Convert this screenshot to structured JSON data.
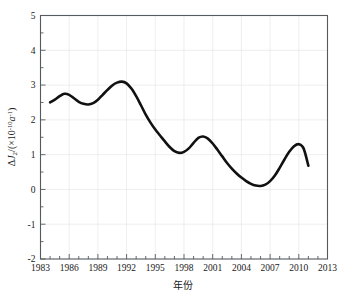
{
  "chart_data": {
    "type": "line",
    "title": "",
    "xlabel": "年份",
    "ylabel": "ΔJ2/(×10^-10 a^-1)",
    "ylabel_parts": {
      "delta": "Δ",
      "symbol": "J",
      "subscript": "2",
      "divider": "/(×10",
      "exponent1": "-10",
      "unit": "a",
      "exponent2": "-1",
      "close": ")"
    },
    "xlim": [
      1983,
      2013
    ],
    "ylim": [
      -2,
      5
    ],
    "xticks": [
      1983,
      1986,
      1989,
      1992,
      1995,
      1998,
      2001,
      2004,
      2007,
      2010,
      2013
    ],
    "xtick_labels": [
      "1983",
      "1986",
      "1989",
      "1992",
      "1995",
      "1998",
      "2001",
      "2004",
      "2007",
      "2010",
      "2013"
    ],
    "yticks": [
      -2,
      -1,
      0,
      1,
      2,
      3,
      4,
      5
    ],
    "ytick_labels": [
      "-2",
      "-1",
      "0",
      "1",
      "2",
      "3",
      "4",
      "5"
    ],
    "xtick_minor_step": 1,
    "ytick_minor_step": 0.5,
    "grid": true,
    "legend": "none",
    "line_color": "#111111",
    "grid_color": "#e2e2e2",
    "frame_color": "#555a5e",
    "series": [
      {
        "name": "ΔJ2",
        "x": [
          1984.0,
          1984.5,
          1985.0,
          1985.5,
          1986.0,
          1986.5,
          1987.0,
          1987.5,
          1988.0,
          1988.5,
          1989.0,
          1989.5,
          1990.0,
          1990.5,
          1991.0,
          1991.5,
          1992.0,
          1992.5,
          1993.0,
          1993.5,
          1994.0,
          1994.5,
          1995.0,
          1995.5,
          1996.0,
          1996.5,
          1997.0,
          1997.5,
          1998.0,
          1998.5,
          1999.0,
          1999.5,
          2000.0,
          2000.5,
          2001.0,
          2001.5,
          2002.0,
          2002.5,
          2003.0,
          2003.5,
          2004.0,
          2004.5,
          2005.0,
          2005.5,
          2006.0,
          2006.5,
          2007.0,
          2007.5,
          2008.0,
          2008.5,
          2009.0,
          2009.5,
          2010.0,
          2010.5,
          2011.0
        ],
        "y": [
          2.5,
          2.58,
          2.68,
          2.75,
          2.72,
          2.62,
          2.52,
          2.46,
          2.44,
          2.48,
          2.58,
          2.72,
          2.86,
          2.99,
          3.07,
          3.1,
          3.05,
          2.9,
          2.68,
          2.42,
          2.15,
          1.92,
          1.72,
          1.55,
          1.38,
          1.22,
          1.1,
          1.05,
          1.08,
          1.18,
          1.34,
          1.48,
          1.52,
          1.46,
          1.32,
          1.14,
          0.95,
          0.76,
          0.6,
          0.46,
          0.34,
          0.24,
          0.16,
          0.11,
          0.1,
          0.14,
          0.24,
          0.4,
          0.62,
          0.86,
          1.08,
          1.24,
          1.3,
          1.18,
          0.68
        ]
      }
    ],
    "annotations": {
      "peaks": [
        {
          "year": 1985.5,
          "value": 2.75
        },
        {
          "year": 1991.5,
          "value": 3.1
        },
        {
          "year": 2000.0,
          "value": 1.52
        },
        {
          "year": 2010.0,
          "value": 1.3
        }
      ],
      "troughs": [
        {
          "year": 1988.0,
          "value": 2.44
        },
        {
          "year": 1997.5,
          "value": 1.05
        },
        {
          "year": 2006.0,
          "value": 0.1
        }
      ]
    }
  },
  "caption": {
    "text": "图",
    "visible": false
  }
}
